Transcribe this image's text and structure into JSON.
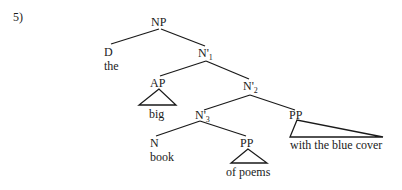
{
  "example_number": "5)",
  "tree": {
    "root": {
      "label": "NP"
    },
    "det": {
      "label": "D",
      "word": "the"
    },
    "nbar1": {
      "label": "N'",
      "subscript": "1"
    },
    "ap": {
      "label": "AP",
      "word": "big"
    },
    "nbar2": {
      "label": "N'",
      "subscript": "2"
    },
    "nbar3": {
      "label": "N'",
      "subscript": "3"
    },
    "pp_high": {
      "label": "PP",
      "words": "with the blue cover"
    },
    "noun": {
      "label": "N",
      "word": "book"
    },
    "pp_low": {
      "label": "PP",
      "words": "of poems"
    }
  },
  "colors": {
    "ink": "#1a1a1a",
    "background": "#ffffff"
  }
}
